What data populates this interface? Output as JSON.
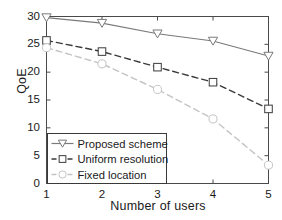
{
  "chart_data": {
    "type": "line",
    "title": "",
    "xlabel": "Number of users",
    "ylabel": "QoE",
    "x": [
      1,
      2,
      3,
      4,
      5
    ],
    "xlim": [
      1,
      5
    ],
    "ylim": [
      0,
      30
    ],
    "xticks": [
      "1",
      "2",
      "3",
      "4",
      "5"
    ],
    "yticks": [
      "0",
      "5",
      "10",
      "15",
      "20",
      "25",
      "30"
    ],
    "grid": false,
    "legend_position": "lower-left",
    "series": [
      {
        "name": "Proposed scheme",
        "values": [
          29.8,
          28.8,
          26.9,
          25.6,
          22.9
        ],
        "marker": "triangle-down",
        "linestyle": "solid",
        "color": "#7a7a7a"
      },
      {
        "name": "Uniform resolution",
        "values": [
          25.7,
          23.7,
          20.9,
          18.2,
          13.4
        ],
        "marker": "square",
        "linestyle": "dashed",
        "color": "#3a3a3a"
      },
      {
        "name": "Fixed location",
        "values": [
          24.4,
          21.5,
          16.9,
          11.6,
          3.3
        ],
        "marker": "circle",
        "linestyle": "dashed",
        "color": "#c4c4c4"
      }
    ]
  },
  "axes": {
    "ylabel": "QoE",
    "xlabel": "Number of users",
    "ytick_labels": [
      "30",
      "25",
      "20",
      "15",
      "10",
      "5",
      "0"
    ],
    "xtick_labels": [
      "1",
      "2",
      "3",
      "4",
      "5"
    ]
  },
  "legend": {
    "items": [
      {
        "label": "Proposed scheme"
      },
      {
        "label": "Uniform resolution"
      },
      {
        "label": "Fixed location"
      }
    ]
  },
  "colors": {
    "axis": "#4a4a4a",
    "series_1": "#7a7a7a",
    "series_2": "#3a3a3a",
    "series_3": "#c4c4c4",
    "text": "#1a1a1a"
  }
}
